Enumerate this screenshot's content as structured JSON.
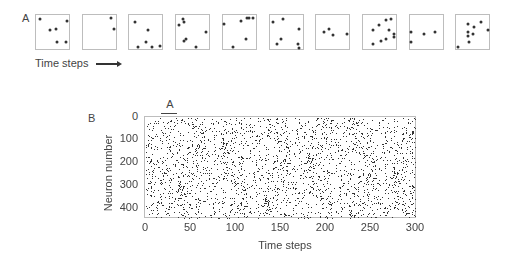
{
  "figure": {
    "panel_a": {
      "label": "A",
      "time_axis_label": "Time steps",
      "arrow_icon": "right-arrow",
      "snapshots": [
        {
          "dots": [
            [
              0.12,
              0.12
            ],
            [
              0.93,
              0.17
            ],
            [
              0.42,
              0.45
            ],
            [
              0.62,
              0.41
            ],
            [
              0.64,
              0.78
            ],
            [
              0.9,
              0.78
            ]
          ]
        },
        {
          "dots": [
            [
              0.85,
              0.1
            ],
            [
              0.95,
              0.4
            ]
          ]
        },
        {
          "dots": [
            [
              0.17,
              0.2
            ],
            [
              0.55,
              0.45
            ],
            [
              0.5,
              0.8
            ],
            [
              0.25,
              0.95
            ],
            [
              0.7,
              0.95
            ],
            [
              0.92,
              0.9
            ]
          ]
        },
        {
          "dots": [
            [
              0.2,
              0.12
            ],
            [
              0.25,
              0.2
            ],
            [
              0.08,
              0.3
            ],
            [
              0.3,
              0.7
            ],
            [
              0.25,
              0.75
            ],
            [
              0.92,
              0.5
            ],
            [
              0.6,
              0.95
            ]
          ]
        },
        {
          "dots": [
            [
              0.05,
              0.25
            ],
            [
              0.55,
              0.17
            ],
            [
              0.72,
              0.1
            ],
            [
              0.78,
              0.1
            ],
            [
              0.93,
              0.1
            ],
            [
              0.7,
              0.7
            ],
            [
              0.32,
              0.95
            ]
          ]
        },
        {
          "dots": [
            [
              0.12,
              0.22
            ],
            [
              0.4,
              0.12
            ],
            [
              0.9,
              0.42
            ],
            [
              0.35,
              0.72
            ],
            [
              0.22,
              0.85
            ],
            [
              0.85,
              0.85
            ],
            [
              0.88,
              0.98
            ]
          ]
        },
        {
          "dots": [
            [
              0.25,
              0.5
            ],
            [
              0.4,
              0.4
            ],
            [
              0.5,
              0.6
            ],
            [
              0.92,
              0.55
            ]
          ]
        },
        {
          "dots": [
            [
              0.5,
              0.3
            ],
            [
              0.7,
              0.15
            ],
            [
              0.85,
              0.12
            ],
            [
              0.3,
              0.45
            ],
            [
              0.78,
              0.45
            ],
            [
              0.95,
              0.55
            ],
            [
              0.95,
              0.65
            ],
            [
              0.3,
              0.85
            ],
            [
              0.55,
              0.75
            ],
            [
              0.7,
              0.72
            ]
          ]
        },
        {
          "dots": [
            [
              0.05,
              0.5
            ],
            [
              0.45,
              0.55
            ],
            [
              0.78,
              0.5
            ],
            [
              0.05,
              0.8
            ]
          ]
        },
        {
          "dots": [
            [
              0.35,
              0.25
            ],
            [
              0.75,
              0.2
            ],
            [
              0.55,
              0.35
            ],
            [
              0.35,
              0.5
            ],
            [
              0.5,
              0.55
            ],
            [
              0.35,
              0.62
            ],
            [
              0.95,
              0.45
            ],
            [
              0.4,
              0.8
            ],
            [
              0.05,
              0.95
            ]
          ]
        }
      ]
    },
    "panel_b": {
      "label": "B",
      "highlight_marker": "A"
    }
  },
  "chart_data": {
    "type": "scatter",
    "title": "",
    "subtitle": "Raster plot of neuron spikes",
    "xlabel": "Time steps",
    "ylabel": "Neuron number",
    "xlim": [
      0,
      300
    ],
    "ylim": [
      0,
      440
    ],
    "y_inverted": true,
    "x_ticks": [
      "0",
      "50",
      "100",
      "150",
      "200",
      "250",
      "300"
    ],
    "y_ticks": [
      "0",
      "100",
      "200",
      "300",
      "400"
    ],
    "grid": false,
    "legend": null,
    "annotations": [
      {
        "text": "A",
        "x_range": [
          20,
          35
        ],
        "note": "bar marks the window shown in panel A"
      }
    ],
    "series": [
      {
        "name": "spikes",
        "description": "dense random spike raster, roughly uniform across 440 neurons and 300 time steps",
        "approx_density": 0.02
      }
    ]
  }
}
